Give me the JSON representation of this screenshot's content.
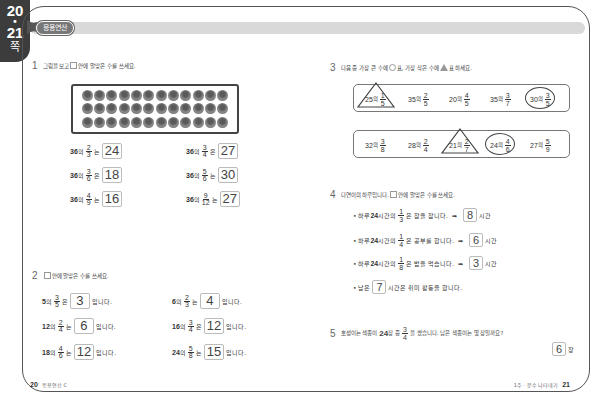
{
  "side_tab": {
    "page_start": "20",
    "dot": "•",
    "page_end": "21",
    "suffix": "쪽"
  },
  "header": {
    "badge": "응용연산"
  },
  "problem1": {
    "number": "1",
    "instruction_a": "그림을 보고",
    "instruction_b": "안에 알맞은 수를 쓰세요.",
    "apple_grid": {
      "rows": 3,
      "cols": 12,
      "total": 36
    },
    "items": [
      {
        "whole": "36",
        "particle": "의",
        "num": "2",
        "den": "3",
        "topic": "는",
        "answer": "24"
      },
      {
        "whole": "36",
        "particle": "의",
        "num": "3",
        "den": "4",
        "topic": "은",
        "answer": "27"
      },
      {
        "whole": "36",
        "particle": "의",
        "num": "3",
        "den": "6",
        "topic": "은",
        "answer": "18"
      },
      {
        "whole": "36",
        "particle": "의",
        "num": "5",
        "den": "6",
        "topic": "는",
        "answer": "30"
      },
      {
        "whole": "36",
        "particle": "의",
        "num": "4",
        "den": "9",
        "topic": "는",
        "answer": "16"
      },
      {
        "whole": "36",
        "particle": "의",
        "num": "9",
        "den": "12",
        "topic": "는",
        "answer": "27"
      }
    ]
  },
  "problem2": {
    "number": "2",
    "instruction": "안에 알맞은 수를 쓰세요.",
    "suffix": "입니다.",
    "items": [
      {
        "whole": "5",
        "particle": "의",
        "num": "3",
        "den": "5",
        "topic": "은",
        "answer": "3"
      },
      {
        "whole": "6",
        "particle": "의",
        "num": "2",
        "den": "3",
        "topic": "는",
        "answer": "4"
      },
      {
        "whole": "12",
        "particle": "의",
        "num": "2",
        "den": "4",
        "topic": "는",
        "answer": "6"
      },
      {
        "whole": "16",
        "particle": "의",
        "num": "3",
        "den": "4",
        "topic": "은",
        "answer": "12"
      },
      {
        "whole": "18",
        "particle": "의",
        "num": "4",
        "den": "6",
        "topic": "는",
        "answer": "12"
      },
      {
        "whole": "24",
        "particle": "의",
        "num": "5",
        "den": "8",
        "topic": "는",
        "answer": "15"
      }
    ]
  },
  "problem3": {
    "number": "3",
    "instruction_a": "다음 중 가장 큰 수에",
    "instruction_b": "표, 가장 작은 수에",
    "instruction_c": "표 하세요.",
    "groups": [
      {
        "items": [
          {
            "whole": "25",
            "particle": "의",
            "num": "1",
            "den": "5",
            "mark": "triangle"
          },
          {
            "whole": "35",
            "particle": "의",
            "num": "2",
            "den": "5",
            "mark": ""
          },
          {
            "whole": "20",
            "particle": "의",
            "num": "4",
            "den": "5",
            "mark": ""
          },
          {
            "whole": "35",
            "particle": "의",
            "num": "3",
            "den": "7",
            "mark": ""
          },
          {
            "whole": "30",
            "particle": "의",
            "num": "3",
            "den": "5",
            "mark": "circle"
          }
        ]
      },
      {
        "items": [
          {
            "whole": "32",
            "particle": "의",
            "num": "3",
            "den": "8",
            "mark": ""
          },
          {
            "whole": "28",
            "particle": "의",
            "num": "2",
            "den": "4",
            "mark": ""
          },
          {
            "whole": "21",
            "particle": "의",
            "num": "2",
            "den": "7",
            "mark": "triangle"
          },
          {
            "whole": "24",
            "particle": "의",
            "num": "4",
            "den": "6",
            "mark": "circle"
          },
          {
            "whole": "27",
            "particle": "의",
            "num": "5",
            "den": "9",
            "mark": ""
          }
        ]
      }
    ]
  },
  "problem4": {
    "number": "4",
    "instruction_a": "다연이의 하루입니다.",
    "instruction_b": "안에 알맞은 수를 쓰세요.",
    "bullets": [
      {
        "prefix": "• 하루 ",
        "hours": "24",
        "mid": "시간의",
        "num": "1",
        "den": "3",
        "text": "은 잠을 잡니다.",
        "arrow": "➡",
        "answer": "8",
        "unit": "시간"
      },
      {
        "prefix": "• 하루 ",
        "hours": "24",
        "mid": "시간의",
        "num": "1",
        "den": "4",
        "text": "은 공부를 합니다.",
        "arrow": "➡",
        "answer": "6",
        "unit": "시간"
      },
      {
        "prefix": "• 하루 ",
        "hours": "24",
        "mid": "시간의",
        "num": "1",
        "den": "8",
        "text": "은 밥을 먹습니다.",
        "arrow": "➡",
        "answer": "3",
        "unit": "시간"
      }
    ],
    "remaining": {
      "prefix": "• 남은",
      "answer": "7",
      "suffix": "시간은 취미 활동을 합니다."
    }
  },
  "problem5": {
    "number": "5",
    "text_a": "호성이는 색종이",
    "count": "24",
    "text_b": "장 중",
    "num": "3",
    "den": "4",
    "text_c": "을 썼습니다. 남은 색종이는 몇 장일까요?",
    "answer": "6",
    "unit": "장"
  },
  "footer": {
    "left_page": "20",
    "left_label": "응용연산 C",
    "right_label": "1주 · 분수 나타내기",
    "right_page": "21"
  }
}
